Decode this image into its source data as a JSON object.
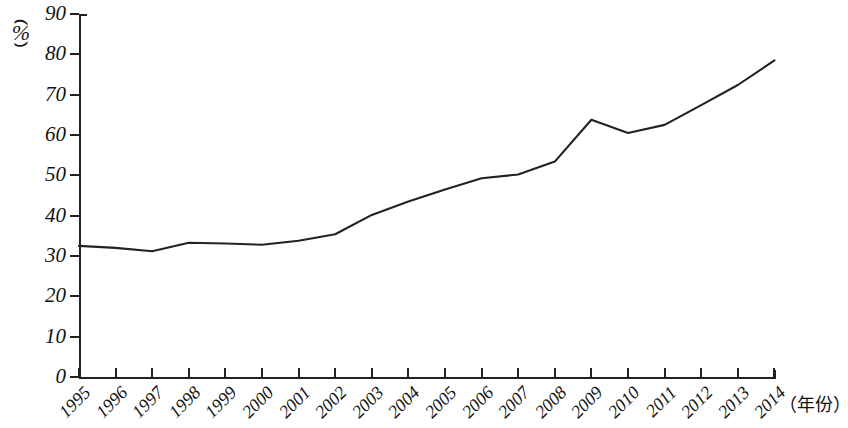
{
  "chart_data": {
    "type": "line",
    "title": "",
    "xlabel": "（年份）",
    "ylabel": "（%）",
    "ylim": [
      0,
      90
    ],
    "ytick_values": [
      0,
      10,
      20,
      30,
      40,
      50,
      60,
      70,
      80,
      90
    ],
    "ytick_labels": [
      "0",
      "10",
      "20",
      "30",
      "40",
      "50",
      "60",
      "70",
      "80",
      "90"
    ],
    "grid": false,
    "legend": "none",
    "categories": [
      "1995",
      "1996",
      "1997",
      "1998",
      "1999",
      "2000",
      "2001",
      "2002",
      "2003",
      "2004",
      "2005",
      "2006",
      "2007",
      "2008",
      "2009",
      "2010",
      "2011",
      "2012",
      "2013",
      "2014"
    ],
    "series": [
      {
        "name": "",
        "color": "#222222",
        "values": [
          32.5,
          32.0,
          31.2,
          33.3,
          33.1,
          32.8,
          33.8,
          35.4,
          40.2,
          43.5,
          46.5,
          49.3,
          50.2,
          53.4,
          63.8,
          60.5,
          62.5,
          67.4,
          72.4,
          78.5
        ]
      }
    ]
  },
  "axis": {
    "y_unit_paren_open": "（",
    "y_unit_symbol": "%",
    "y_unit_paren_close": "）",
    "x_title": "（年份）"
  },
  "colors": {
    "line": "#222222",
    "axis": "#222222",
    "background": "#ffffff",
    "text": "#111111"
  }
}
